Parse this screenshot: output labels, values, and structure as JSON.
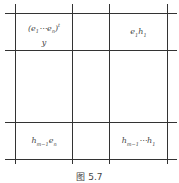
{
  "figure": {
    "caption": "图 5.7",
    "cells": {
      "top_left_line1": "(e",
      "top_left_line2": "y",
      "top_right": "e",
      "bottom_left": "h",
      "bottom_right": "h"
    },
    "labels_full": {
      "top_left": "(e1⋯en)t / y",
      "top_right": "e1 h1",
      "bottom_left": "h_{m-1} e_n",
      "bottom_right": "h_{m-1}⋯h_1"
    }
  }
}
